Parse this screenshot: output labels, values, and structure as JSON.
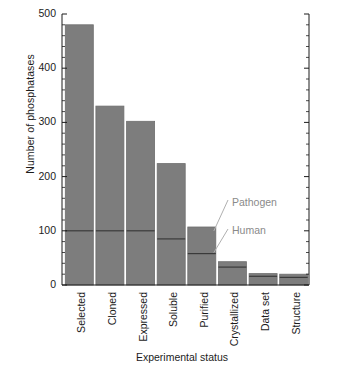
{
  "chart_data": {
    "type": "bar",
    "title": "",
    "subtitle": "",
    "xlabel": "Experimental status",
    "ylabel": "Number of phosphatases",
    "categories": [
      "Selected",
      "Cloned",
      "Expressed",
      "Soluble",
      "Purified",
      "Crystallized",
      "Data set",
      "Structure"
    ],
    "values": [
      480,
      330,
      302,
      224,
      107,
      43,
      21,
      20
    ],
    "series": [
      {
        "name": "Human",
        "values": [
          100,
          100,
          100,
          85,
          58,
          33,
          16,
          14
        ]
      },
      {
        "name": "Pathogen",
        "values": [
          380,
          230,
          202,
          139,
          49,
          10,
          5,
          6
        ]
      }
    ],
    "stacked": true,
    "ylim": [
      0,
      500
    ],
    "yticks": [
      0,
      100,
      200,
      300,
      400,
      500
    ],
    "ytick_labels": [
      "0",
      "100",
      "200",
      "300",
      "400",
      "500"
    ],
    "yminor_step": 20,
    "grid": false,
    "legend_position": "inline-annotations",
    "annotations": [
      {
        "text": "Pathogen",
        "target_category": "Purified",
        "target_value": 107
      },
      {
        "text": "Human",
        "target_category": "Purified",
        "target_value": 58
      }
    ],
    "colors": {
      "bar_fill": "#7d7d7d",
      "bar_edge": "#6e6e6e",
      "divider_line": "#3a3a3a",
      "axis": "#1c1c1c",
      "annotation_text": "#8a8a8a",
      "annotation_leader": "#b0b0b0",
      "background": "#ffffff"
    }
  },
  "axis": {
    "y_label": "Number of phosphatases",
    "x_label": "Experimental status",
    "y_tick_labels": [
      "0",
      "100",
      "200",
      "300",
      "400",
      "500"
    ],
    "x_tick_labels": [
      "Selected",
      "Cloned",
      "Expressed",
      "Soluble",
      "Purified",
      "Crystallized",
      "Data set",
      "Structure"
    ]
  },
  "annotations": {
    "pathogen_label": "Pathogen",
    "human_label": "Human"
  }
}
